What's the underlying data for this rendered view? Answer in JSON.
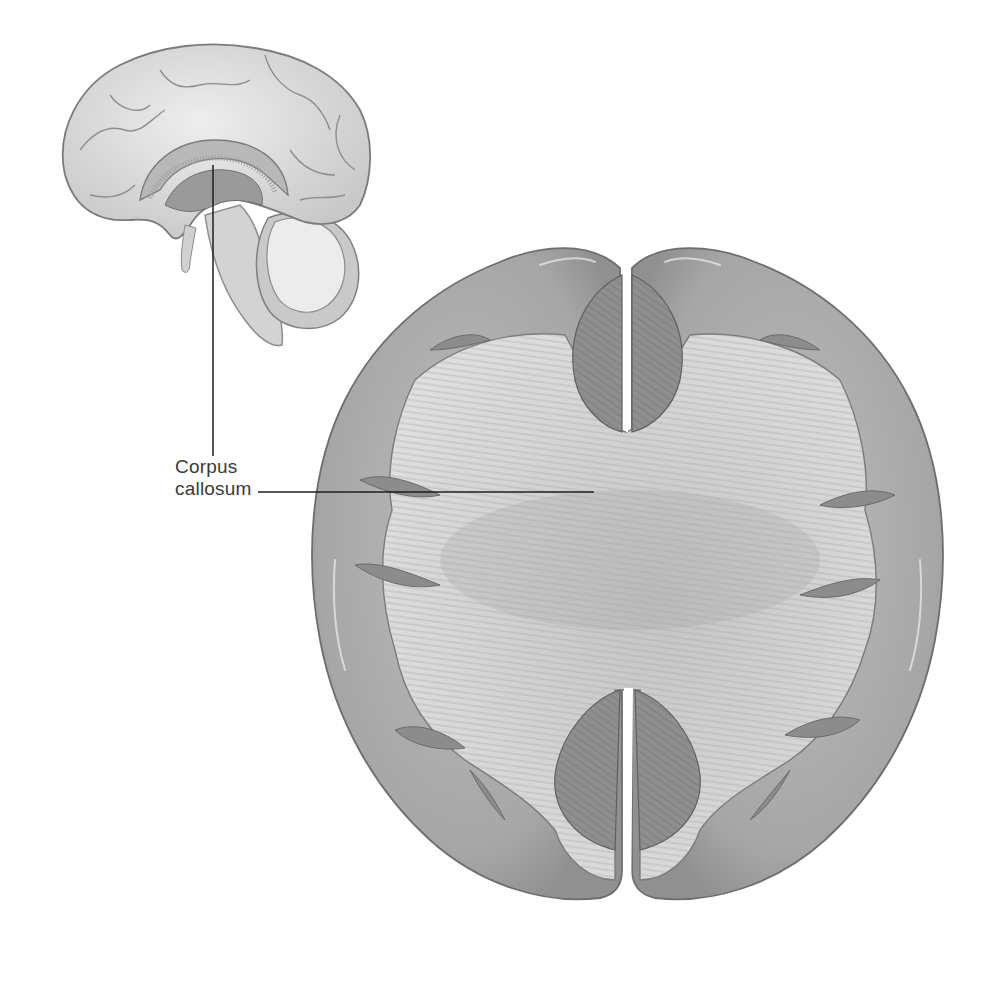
{
  "figure": {
    "views": [
      {
        "id": "sagittal",
        "description": "Midsagittal section of brain (medial view)"
      },
      {
        "id": "superior",
        "description": "Superior view of cerebrum with cortex dissected to expose corpus callosum fibers"
      }
    ],
    "labels": [
      {
        "line1": "Corpus",
        "line2": "callosum"
      }
    ],
    "colors": {
      "background": "#ffffff",
      "cortex": "#a9a9a9",
      "cortex_light": "#c8c8c8",
      "white_matter": "#d9d9d9",
      "fibers": "#9c9c9c",
      "ventricle": "#8a8a8a",
      "leader_line": "#1e1e1e",
      "label_text": "#3a3a3a"
    }
  }
}
